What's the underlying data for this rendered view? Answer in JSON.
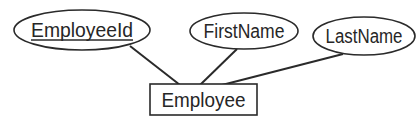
{
  "diagram": {
    "type": "entity-relationship",
    "entity": {
      "name": "Employee",
      "x": 150,
      "y": 84,
      "width": 107,
      "height": 31
    },
    "attributes": [
      {
        "name": "EmployeeId",
        "primary_key": true,
        "cx": 82,
        "cy": 30,
        "rx": 68,
        "ry": 20,
        "line": {
          "x1": 130,
          "y1": 46,
          "x2": 180,
          "y2": 85
        }
      },
      {
        "name": "FirstName",
        "primary_key": false,
        "cx": 244,
        "cy": 31,
        "rx": 54,
        "ry": 18,
        "line": {
          "x1": 237,
          "y1": 49,
          "x2": 200,
          "y2": 85
        }
      },
      {
        "name": "LastName",
        "primary_key": false,
        "cx": 364,
        "cy": 36,
        "rx": 51,
        "ry": 19,
        "line": {
          "x1": 343,
          "y1": 54,
          "x2": 222,
          "y2": 85
        }
      }
    ],
    "colors": {
      "stroke": "#2a2a2a",
      "text": "#262626",
      "background": "#ffffff"
    }
  }
}
